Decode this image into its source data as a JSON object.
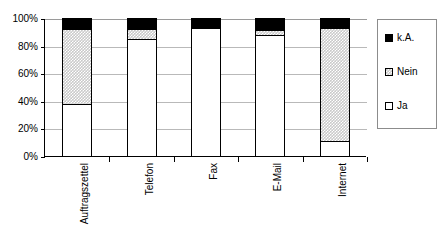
{
  "title": {
    "text": "",
    "cropped": true
  },
  "chart_data": {
    "type": "bar",
    "stacked": true,
    "percent_stacked": true,
    "title": "",
    "xlabel": "",
    "ylabel": "",
    "ylim": [
      0,
      100
    ],
    "ytick_labels": [
      "100%",
      "80%",
      "60%",
      "40%",
      "20%",
      "0%"
    ],
    "ytick_values": [
      100,
      80,
      60,
      40,
      20,
      0
    ],
    "grid": true,
    "legend_position": "right",
    "categories": [
      "Auftragszettel",
      "Telefon",
      "Fax",
      "E-Mail",
      "Internet"
    ],
    "series": [
      {
        "name": "Ja",
        "values": [
          38,
          85,
          93,
          88,
          11
        ]
      },
      {
        "name": "Nein",
        "values": [
          54,
          7,
          0,
          3,
          82
        ]
      },
      {
        "name": "k.A.",
        "values": [
          8,
          8,
          7,
          9,
          7
        ]
      }
    ]
  },
  "legend": {
    "items": [
      {
        "label": "k.A.",
        "swatch": "black-swatch"
      },
      {
        "label": "Nein",
        "swatch": "gray-dotted-swatch"
      },
      {
        "label": "Ja",
        "swatch": "white-swatch"
      }
    ]
  }
}
